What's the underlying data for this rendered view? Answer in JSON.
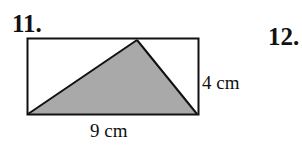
{
  "problems": [
    {
      "number": "11."
    },
    {
      "number": "12."
    }
  ],
  "figure": {
    "shape": "rectangle with inscribed shaded triangle",
    "height_label": "4 cm",
    "width_label": "9 cm",
    "shade_color": "#a9a9a9",
    "line_color": "#111111"
  }
}
